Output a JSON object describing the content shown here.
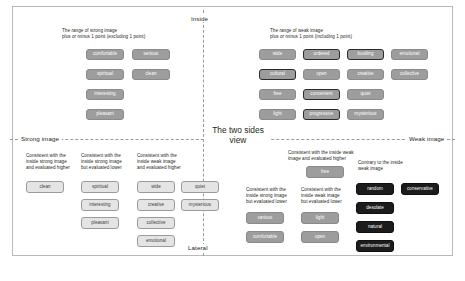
{
  "figure": {
    "axes": {
      "top_label": "Inside",
      "bottom_label": "Lateral",
      "left_label": "Strong image",
      "right_label": "Weak image",
      "center_label": "The two\nsides view"
    },
    "caption": ""
  },
  "quadrants": {
    "top_left": {
      "caption": "The range of strong image\nplus or minus 1 point (excluding 1 point)",
      "boxes": [
        {
          "label": "comfortable",
          "style": "grey"
        },
        {
          "label": "serious",
          "style": "grey"
        },
        {
          "label": "spiritual",
          "style": "grey"
        },
        {
          "label": "clean",
          "style": "grey"
        },
        {
          "label": "interesting",
          "style": "grey"
        },
        {
          "label": "pleasant",
          "style": "grey"
        }
      ]
    },
    "top_right": {
      "caption": "The range of weak image\nplus or minus 1 point (including 1 point)",
      "boxes": [
        {
          "label": "wide",
          "style": "grey"
        },
        {
          "label": "ordered",
          "style": "grey-out"
        },
        {
          "label": "bustling",
          "style": "grey-out"
        },
        {
          "label": "emotional",
          "style": "grey"
        },
        {
          "label": "cultural",
          "style": "grey-out"
        },
        {
          "label": "open",
          "style": "grey"
        },
        {
          "label": "creative",
          "style": "grey"
        },
        {
          "label": "collective",
          "style": "grey"
        },
        {
          "label": "free",
          "style": "grey"
        },
        {
          "label": "convenient",
          "style": "grey-out"
        },
        {
          "label": "quiet",
          "style": "grey"
        },
        {
          "label": "light",
          "style": "grey"
        },
        {
          "label": "progressive",
          "style": "grey-out"
        },
        {
          "label": "mysterious",
          "style": "grey"
        }
      ]
    },
    "bottom_left": {
      "groups": [
        {
          "caption": "Consistent with the\ninside strong image\nand evaluated higher",
          "boxes": [
            {
              "label": "clean",
              "style": "light"
            }
          ]
        },
        {
          "caption": "Consistent with the\ninside strong image\nbut evaluated lower",
          "boxes": [
            {
              "label": "spiritual",
              "style": "light"
            },
            {
              "label": "interesting",
              "style": "light"
            },
            {
              "label": "pleasant",
              "style": "light"
            }
          ]
        },
        {
          "caption": "Consistent with the\ninside weak image\nand evaluated higher",
          "boxes": [
            {
              "label": "wide",
              "style": "light"
            },
            {
              "label": "quiet",
              "style": "light"
            },
            {
              "label": "creative",
              "style": "light"
            },
            {
              "label": "mysterious",
              "style": "light"
            },
            {
              "label": "collective",
              "style": "light"
            },
            {
              "label": "emotional",
              "style": "light"
            }
          ]
        }
      ]
    },
    "bottom_right": {
      "groups": [
        {
          "caption": "Consistent with the inside weak\nimage and evaluated higher",
          "boxes": [
            {
              "label": "free",
              "style": "grey"
            }
          ]
        },
        {
          "caption": "Consistent with the\ninside strong image\nbut evaluated lower",
          "boxes": [
            {
              "label": "various",
              "style": "grey"
            },
            {
              "label": "comfortable",
              "style": "grey"
            }
          ]
        },
        {
          "caption": "Consistent with the\ninside weak image\nbut evaluated lower",
          "boxes": [
            {
              "label": "light",
              "style": "grey"
            },
            {
              "label": "open",
              "style": "grey"
            }
          ]
        },
        {
          "caption": "Contrary to the inside\nweak image",
          "boxes": [
            {
              "label": "random",
              "style": "dark"
            },
            {
              "label": "conservative",
              "style": "dark"
            },
            {
              "label": "desolate",
              "style": "dark"
            },
            {
              "label": "natural",
              "style": "dark"
            },
            {
              "label": "environmental",
              "style": "dark"
            }
          ]
        }
      ]
    }
  }
}
